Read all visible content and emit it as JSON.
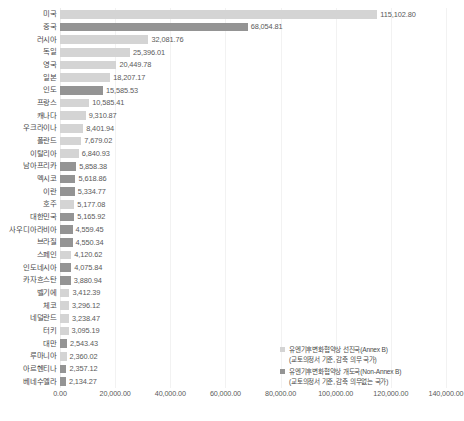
{
  "chart_data": {
    "type": "bar",
    "orientation": "horizontal",
    "title": "",
    "subtitle": "",
    "xlabel": "",
    "ylabel": "",
    "xlim": [
      0,
      140000
    ],
    "grid": true,
    "legend_position": "bottom-right",
    "xticks": [
      "0.00",
      "20,000.00",
      "40,000.00",
      "60,000.00",
      "80,000.00",
      "100,000.00",
      "120,000.00",
      "140,000.00"
    ],
    "xtick_values": [
      0,
      20000,
      40000,
      60000,
      80000,
      100000,
      120000,
      140000
    ],
    "categories": [
      "미국",
      "중국",
      "러시아",
      "독일",
      "영국",
      "일본",
      "인도",
      "프랑스",
      "캐나다",
      "우크라이나",
      "폴란드",
      "이탈리아",
      "남아프리카",
      "멕시코",
      "이란",
      "호주",
      "대한민국",
      "사우디아라비아",
      "브라질",
      "스페인",
      "인도네시아",
      "카자흐스탄",
      "벨기에",
      "체코",
      "네덜란드",
      "터키",
      "대만",
      "루마니아",
      "아르헨티나",
      "베네수엘라"
    ],
    "values": [
      115102.8,
      68054.81,
      32081.76,
      25396.01,
      20449.78,
      18207.17,
      15585.53,
      10585.41,
      9310.87,
      8401.94,
      7679.02,
      6840.93,
      5858.38,
      5618.86,
      5334.77,
      5177.08,
      5165.92,
      4559.45,
      4550.34,
      4120.62,
      4075.84,
      3880.94,
      3412.39,
      3296.12,
      3238.47,
      3095.19,
      2543.43,
      2360.02,
      2357.12,
      2134.27
    ],
    "value_labels": [
      "115,102.80",
      "68,054.81",
      "32,081.76",
      "25,396.01",
      "20,449.78",
      "18,207.17",
      "15,585.53",
      "10,585.41",
      "9,310.87",
      "8,401.94",
      "7,679.02",
      "6,840.93",
      "5,858.38",
      "5,618.86",
      "5,334.77",
      "5,177.08",
      "5,165.92",
      "4,559.45",
      "4,550.34",
      "4,120.62",
      "4,075.84",
      "3,880.94",
      "3,412.39",
      "3,296.12",
      "3,238.47",
      "3,095.19",
      "2,543.43",
      "2,360.02",
      "2,357.12",
      "2,134.27"
    ],
    "group_of_category": [
      "annexb",
      "nonannexb",
      "annexb",
      "annexb",
      "annexb",
      "annexb",
      "nonannexb",
      "annexb",
      "annexb",
      "annexb",
      "annexb",
      "annexb",
      "nonannexb",
      "nonannexb",
      "nonannexb",
      "annexb",
      "nonannexb",
      "nonannexb",
      "nonannexb",
      "annexb",
      "nonannexb",
      "nonannexb",
      "annexb",
      "annexb",
      "annexb",
      "annexb",
      "nonannexb",
      "annexb",
      "nonannexb",
      "nonannexb"
    ],
    "series": [
      {
        "name": "유엔기후변화협약상 선진국(Annex B)",
        "key": "annexb",
        "color": "#d4d4d4"
      },
      {
        "name": "유엔기후변화협약상 개도국(Non-Annex B)",
        "key": "nonannexb",
        "color": "#949494"
      }
    ]
  },
  "legend": {
    "items": [
      {
        "label": "유엔기후변화협약상 선진국(Annex B)",
        "sublabel": "(교토의정서 기준, 감축 의무 국가)",
        "key": "annexb"
      },
      {
        "label": "유엔기후변화협약상 개도국(Non-Annex B)",
        "sublabel": "(교토의정서 기준, 감축 의무없는 국가)",
        "key": "nonannexb"
      }
    ]
  },
  "colors": {
    "annexb": "#d4d4d4",
    "nonannexb": "#949494",
    "gridline": "#f2f2f2",
    "text": "#4a4a4a",
    "background": "#ffffff"
  }
}
